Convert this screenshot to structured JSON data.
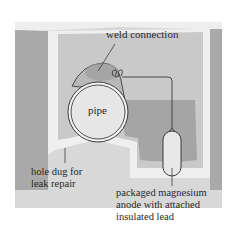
{
  "diagram": {
    "labels": {
      "weld": "weld connection",
      "pipe": "pipe",
      "hole_line1": "hole dug for",
      "hole_line2": "leak repair",
      "anode_line1": "packaged magnesium",
      "anode_line2": "anode with attached",
      "anode_line3": "insulated lead"
    },
    "colors": {
      "background": "#ffffff",
      "soil_light": "#dcdcdc",
      "soil_dark": "#a8a8a8",
      "hole_fill": "#efefef",
      "pipe_face": "#e6e6e6",
      "pipe_body": "#bdbdbd",
      "outline": "#2a2a2a"
    }
  }
}
